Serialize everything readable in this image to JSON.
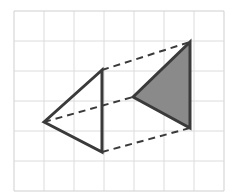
{
  "figure": {
    "canvas": {
      "width": 252,
      "height": 192,
      "background": "#ffffff"
    },
    "grid": {
      "label": "graph-paper-grid",
      "x": 14,
      "y": 11,
      "cell_size": 30,
      "columns": 7,
      "rows": 6,
      "line_color": "#dcdcdc",
      "line_width": 1,
      "major_line_color": "#cfcfcf"
    },
    "shapes": [
      {
        "name": "preimage-triangle",
        "kind": "triangle",
        "fill": "none",
        "stroke": "#3a3a3a",
        "stroke_width": 3,
        "points": "44,122 102,70 102,152",
        "vertices": [
          {
            "label": "A",
            "x": 44,
            "y": 122
          },
          {
            "label": "B",
            "x": 102,
            "y": 70
          },
          {
            "label": "C",
            "x": 102,
            "y": 152
          }
        ]
      },
      {
        "name": "image-triangle",
        "kind": "triangle",
        "fill": "#8a8a8a",
        "stroke": "#3a3a3a",
        "stroke_width": 3,
        "points": "133,97 190,42 190,128",
        "vertices": [
          {
            "label": "A'",
            "x": 133,
            "y": 97
          },
          {
            "label": "B'",
            "x": 190,
            "y": 42
          },
          {
            "label": "C'",
            "x": 190,
            "y": 128
          }
        ]
      }
    ],
    "connectors": {
      "name": "correspondence-dashed-lines",
      "stroke": "#3a3a3a",
      "stroke_width": 2,
      "dash_pattern": "7 5",
      "lines": [
        {
          "name": "dashed-line-top",
          "x1": 102,
          "y1": 70,
          "x2": 190,
          "y2": 42
        },
        {
          "name": "dashed-line-middle",
          "x1": 44,
          "y1": 122,
          "x2": 133,
          "y2": 97
        },
        {
          "name": "dashed-line-bottom",
          "x1": 102,
          "y1": 152,
          "x2": 190,
          "y2": 128
        }
      ]
    }
  }
}
